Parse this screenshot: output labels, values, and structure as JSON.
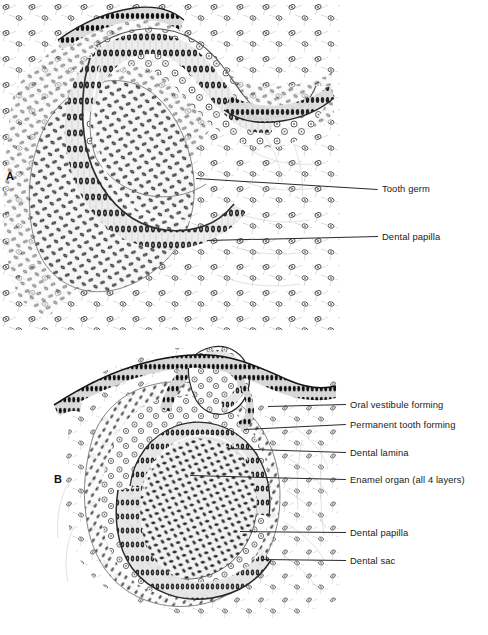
{
  "figure": {
    "background_color": "#ffffff",
    "ink_color": "#1a1a1a",
    "width": 488,
    "height": 635
  },
  "panels": [
    {
      "letter": "A",
      "name": "panel-a",
      "description": "Early bell stage tooth germ with dental papilla",
      "labels": [
        {
          "text": "Tooth germ",
          "label_x": 382,
          "label_y": 184,
          "leader": {
            "x1": 196,
            "y1": 178,
            "x2": 378,
            "y2": 189
          }
        },
        {
          "text": "Dental papilla",
          "label_x": 382,
          "label_y": 232,
          "leader": {
            "x1": 207,
            "y1": 240,
            "x2": 378,
            "y2": 236
          }
        }
      ]
    },
    {
      "letter": "B",
      "name": "panel-b",
      "description": "Late bell stage with permanent tooth bud, enamel organ, dental sac",
      "labels": [
        {
          "text": "Oral vestibule forming",
          "label_x": 350,
          "label_y": 400,
          "leader": {
            "x1": 268,
            "y1": 406,
            "x2": 346,
            "y2": 404
          }
        },
        {
          "text": "Permanent tooth forming",
          "label_x": 350,
          "label_y": 420,
          "leader": {
            "x1": 244,
            "y1": 429,
            "x2": 346,
            "y2": 424
          }
        },
        {
          "text": "Dental lamina",
          "label_x": 350,
          "label_y": 448,
          "leader": {
            "x1": 228,
            "y1": 448,
            "x2": 346,
            "y2": 452
          }
        },
        {
          "text": "Enamel organ (all 4 layers)",
          "label_x": 350,
          "label_y": 475,
          "leader": {
            "x1": 190,
            "y1": 475,
            "x2": 346,
            "y2": 479
          }
        },
        {
          "text": "Dental papilla",
          "label_x": 350,
          "label_y": 528,
          "leader": {
            "x1": 240,
            "y1": 531,
            "x2": 346,
            "y2": 532
          }
        },
        {
          "text": "Dental sac",
          "label_x": 350,
          "label_y": 556,
          "leader": {
            "x1": 262,
            "y1": 559,
            "x2": 346,
            "y2": 560
          }
        }
      ]
    }
  ]
}
